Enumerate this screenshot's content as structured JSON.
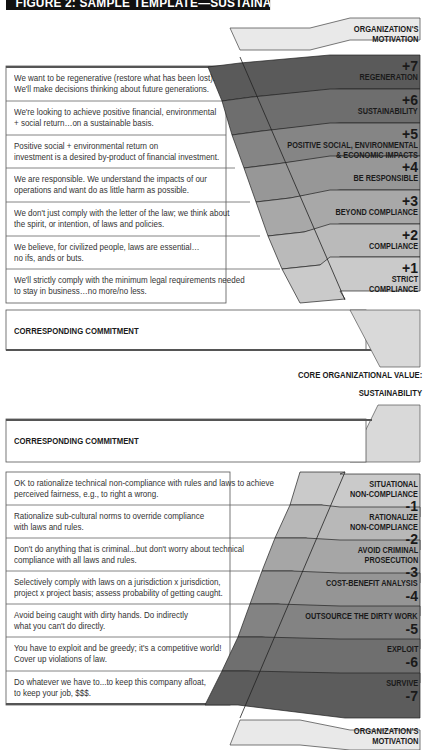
{
  "title": "FIGURE 2: SAMPLE TEMPLATE—SUSTAINABILITY",
  "top_section": {
    "motivation_header": [
      "ORGANIZATION'S",
      "MOTIVATION"
    ],
    "rows": [
      {
        "text": [
          "We want to be regenerative (restore what has been lost).",
          "We'll make decisions thinking about future generations."
        ],
        "level": "+7",
        "label": [
          "REGENERATION"
        ],
        "color": "#5a5a5a"
      },
      {
        "text": [
          "We're looking to achieve positive financial, environmental",
          "+ social return…on a sustainable basis."
        ],
        "level": "+6",
        "label": [
          "SUSTAINABILITY"
        ],
        "color": "#6e6e6e"
      },
      {
        "text": [
          "Positive social + environmental return on",
          "investment is a desired by-product of financial investment."
        ],
        "level": "+5",
        "label": [
          "POSITIVE SOCIAL, ENVIRONMENTAL",
          "& ECONOMIC IMPACTS"
        ],
        "color": "#858585"
      },
      {
        "text": [
          "We are responsible. We understand the impacts of our",
          "operations and want do as little harm as possible."
        ],
        "level": "+4",
        "label": [
          "BE RESPONSIBLE"
        ],
        "color": "#979797"
      },
      {
        "text": [
          "We don't just comply with the letter of the law; we think about",
          "the spirit, or intention, of laws and policies."
        ],
        "level": "+3",
        "label": [
          "BEYOND COMPLIANCE"
        ],
        "color": "#a8a8a8"
      },
      {
        "text": [
          "We believe, for civilized people, laws are essential…",
          "no ifs, ands or buts."
        ],
        "level": "+2",
        "label": [
          "COMPLIANCE"
        ],
        "color": "#bababa"
      },
      {
        "text": [
          "We'll strictly comply with the minimum legal requirements needed",
          "to stay in business…no more/no less."
        ],
        "level": "+1",
        "label": [
          "STRICT",
          "COMPLIANCE"
        ],
        "color": "#cacaca"
      }
    ],
    "commitment_label": "CORRESPONDING COMMITMENT"
  },
  "core_value": {
    "heading": "CORE ORGANIZATIONAL VALUE:",
    "value": "SUSTAINABILITY"
  },
  "bottom_section": {
    "commitment_label": "CORRESPONDING COMMITMENT",
    "rows": [
      {
        "text": [
          "OK to rationalize technical non-compliance with rules and laws to achieve",
          "perceived fairness, e.g., to right a wrong."
        ],
        "level": "-1",
        "label": [
          "SITUATIONAL",
          "NON-COMPLIANCE"
        ],
        "color": "#cacaca"
      },
      {
        "text": [
          "Rationalize sub-cultural norms to override compliance",
          "with laws and rules."
        ],
        "level": "-2",
        "label": [
          "RATIONALIZE",
          "NON-COMPLIANCE"
        ],
        "color": "#b8b8b8"
      },
      {
        "text": [
          "Don't do anything that is criminal...but don't worry about technical",
          "compliance with all laws and rules."
        ],
        "level": "-3",
        "label": [
          "AVOID CRIMINAL",
          "PROSECUTION"
        ],
        "color": "#a6a6a6"
      },
      {
        "text": [
          "Selectively comply with laws on a jurisdiction x jurisdiction,",
          "project x project basis; assess probability of getting caught."
        ],
        "level": "-4",
        "label": [
          "COST-BENEFIT ANALYSIS"
        ],
        "color": "#959595"
      },
      {
        "text": [
          "Avoid being caught with dirty hands. Do indirectly",
          "what you can't do directly."
        ],
        "level": "-5",
        "label": [
          "OUTSOURCE THE DIRTY WORK"
        ],
        "color": "#838383"
      },
      {
        "text": [
          "You have to exploit and be greedy; it's a competitive world!",
          "Cover up violations of law."
        ],
        "level": "-6",
        "label": [
          "EXPLOIT"
        ],
        "color": "#6f6f6f"
      },
      {
        "text": [
          "Do whatever we have to...to keep this company afloat,",
          "to keep your job, $$$."
        ],
        "level": "-7",
        "label": [
          "SURVIVE"
        ],
        "color": "#5c5c5c"
      }
    ],
    "motivation_footer": [
      "ORGANIZATION'S",
      "MOTIVATION"
    ]
  }
}
